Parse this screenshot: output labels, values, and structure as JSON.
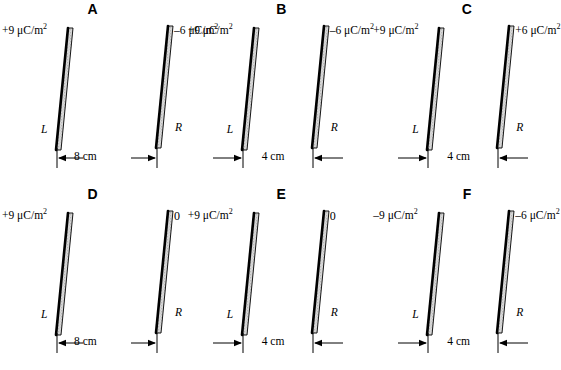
{
  "figure": {
    "plate_fill_color": "#d9d9d9",
    "plate_edge_color": "#000000",
    "background_color": "#ffffff"
  },
  "panels": [
    {
      "letter": "A",
      "left_plate": {
        "label": "L",
        "sigma": "+9 μC/m",
        "sigma_exponent": "2"
      },
      "right_plate": {
        "label": "R",
        "sigma": "–6 μC/m",
        "sigma_exponent": "2"
      },
      "separation": "8 cm",
      "separation_value": 8,
      "separation_unit": "cm",
      "spacing": "wide",
      "arrow_style": "outward"
    },
    {
      "letter": "B",
      "left_plate": {
        "label": "L",
        "sigma": "+9 μC/m",
        "sigma_exponent": "2"
      },
      "right_plate": {
        "label": "R",
        "sigma": "–6 μC/m",
        "sigma_exponent": "2"
      },
      "separation": "4 cm",
      "separation_value": 4,
      "separation_unit": "cm",
      "spacing": "narrow",
      "arrow_style": "inward"
    },
    {
      "letter": "C",
      "left_plate": {
        "label": "L",
        "sigma": "+9 μC/m",
        "sigma_exponent": "2"
      },
      "right_plate": {
        "label": "R",
        "sigma": "+6 μC/m",
        "sigma_exponent": "2"
      },
      "separation": "4 cm",
      "separation_value": 4,
      "separation_unit": "cm",
      "spacing": "narrow",
      "arrow_style": "inward"
    },
    {
      "letter": "D",
      "left_plate": {
        "label": "L",
        "sigma": "+9 μC/m",
        "sigma_exponent": "2"
      },
      "right_plate": {
        "label": "R",
        "sigma": "0",
        "sigma_exponent": ""
      },
      "separation": "8 cm",
      "separation_value": 8,
      "separation_unit": "cm",
      "spacing": "wide",
      "arrow_style": "outward"
    },
    {
      "letter": "E",
      "left_plate": {
        "label": "L",
        "sigma": "+9 μC/m",
        "sigma_exponent": "2"
      },
      "right_plate": {
        "label": "R",
        "sigma": "0",
        "sigma_exponent": ""
      },
      "separation": "4 cm",
      "separation_value": 4,
      "separation_unit": "cm",
      "spacing": "narrow",
      "arrow_style": "inward"
    },
    {
      "letter": "F",
      "left_plate": {
        "label": "L",
        "sigma": "–9 μC/m",
        "sigma_exponent": "2"
      },
      "right_plate": {
        "label": "R",
        "sigma": "–6 μC/m",
        "sigma_exponent": "2"
      },
      "separation": "4 cm",
      "separation_value": 4,
      "separation_unit": "cm",
      "spacing": "narrow",
      "arrow_style": "inward"
    }
  ]
}
